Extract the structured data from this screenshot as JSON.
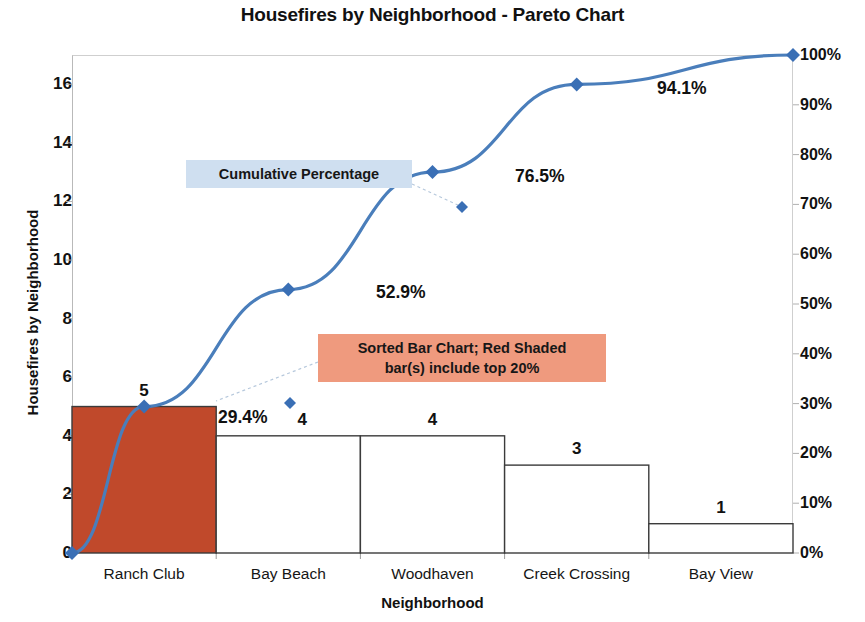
{
  "chart_data": {
    "type": "bar",
    "title": "Housefires by Neighborhood - Pareto Chart",
    "xlabel": "Neighborhood",
    "ylabel": "Housefires by Neighborhood",
    "y2label": "",
    "categories": [
      "Ranch Club",
      "Bay Beach",
      "Woodhaven",
      "Creek Crossing",
      "Bay View"
    ],
    "values": [
      5,
      4,
      4,
      3,
      1
    ],
    "value_labels": [
      "5",
      "4",
      "4",
      "3",
      "1"
    ],
    "bar_colors": [
      "#c0492b",
      "#ffffff",
      "#ffffff",
      "#ffffff",
      "#ffffff"
    ],
    "series": [
      {
        "name": "Housefires by Neighborhood",
        "type": "bar",
        "values": [
          5,
          4,
          4,
          3,
          1
        ]
      },
      {
        "name": "Cumulative Percentage",
        "type": "line",
        "values": [
          29.4,
          52.9,
          76.5,
          94.1,
          100.0
        ],
        "labels": [
          "29.4%",
          "52.9%",
          "76.5%",
          "94.1%",
          ""
        ],
        "color": "#4a7ebb",
        "marker": "diamond",
        "starts_at_origin": true
      }
    ],
    "ylim": [
      0,
      17
    ],
    "yticks": [
      0,
      2,
      4,
      6,
      8,
      10,
      12,
      14,
      16
    ],
    "ytick_labels": [
      "0",
      "2",
      "4",
      "6",
      "8",
      "10",
      "12",
      "14",
      "16"
    ],
    "y2lim": [
      0,
      100
    ],
    "y2ticks": [
      0,
      10,
      20,
      30,
      40,
      50,
      60,
      70,
      80,
      90,
      100
    ],
    "y2tick_labels": [
      "0%",
      "10%",
      "20%",
      "30%",
      "40%",
      "50%",
      "60%",
      "70%",
      "80%",
      "90%",
      "100%"
    ],
    "grid": false,
    "legend": "none",
    "annotations": [
      {
        "id": "cumulative-percentage",
        "text": "Cumulative Percentage",
        "background": "#cfdff0"
      },
      {
        "id": "sorted-bar-note",
        "text": "Sorted Bar Chart; Red Shaded\nbar(s) include top 20%",
        "background": "#ef9a7e"
      }
    ]
  },
  "colors": {
    "bar_highlight": "#c0492b",
    "bar_default": "#ffffff",
    "bar_border": "#3b3b3b",
    "line": "#4a7ebb",
    "marker": "#3a6fb5",
    "callout_blue": "#cfdff0",
    "callout_red": "#ef9a7e",
    "text": "#111111"
  }
}
